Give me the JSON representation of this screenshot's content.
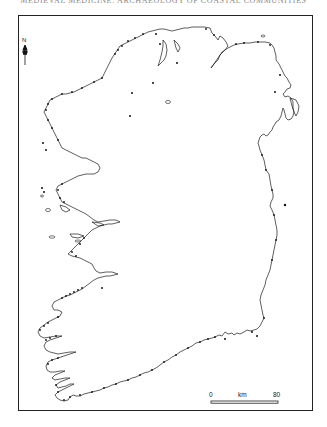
{
  "page": {
    "running_head": "MEDIEVAL MEDICINE: ARCHAEOLOGY OF COASTAL COMMUNITIES"
  },
  "map": {
    "subject": "Ireland coastline",
    "north_arrow": {
      "label": "N",
      "icon": "north-arrow-icon"
    },
    "scale_bar": {
      "start_label": "0",
      "unit_label": "km",
      "end_label": "80"
    },
    "symbols": {
      "site_marker": "filled-dot",
      "color": "#111111"
    },
    "coastline_color": "#1a1a1a",
    "frame_color": "#222222"
  }
}
